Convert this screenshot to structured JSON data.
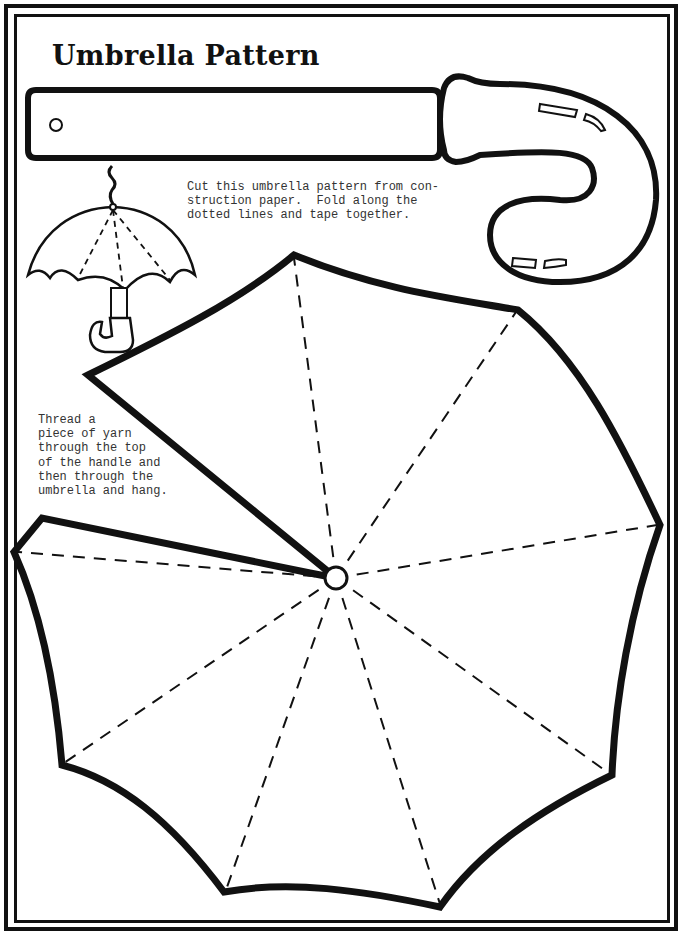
{
  "document": {
    "title": "Umbrella Pattern",
    "instructions_lines": [
      "Cut this umbrella pattern from con-",
      "struction paper.  Fold along the",
      "dotted lines and tape together."
    ],
    "thread_note_lines": [
      "Thread a",
      "piece of yarn",
      "through the top",
      "of the handle and",
      "then through the",
      "umbrella and hang."
    ]
  },
  "colors": {
    "ink": "#111111",
    "paper": "#ffffff",
    "text": "#333333"
  },
  "icons": {
    "illustration": "umbrella-example-icon",
    "handle_pattern": "umbrella-handle-pattern",
    "canopy_pattern": "umbrella-canopy-pattern",
    "hole": "yarn-hole-icon",
    "center": "canopy-center-hole-icon"
  }
}
